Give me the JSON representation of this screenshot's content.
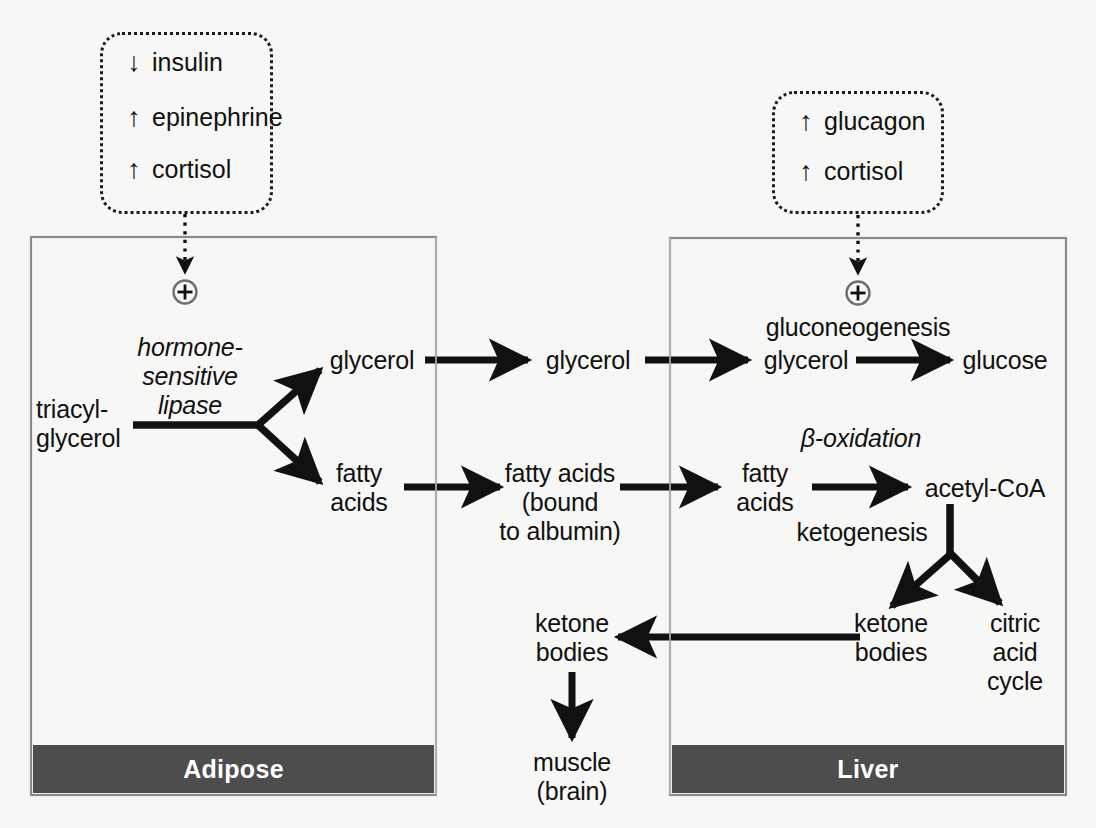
{
  "diagram": {
    "background_color": "#f7f7f5",
    "organ_bar_color": "#4d4d4d",
    "line_color": "#111111"
  },
  "hormone_boxes": [
    {
      "id": "adipose-hormones",
      "rows": [
        {
          "arrow": "↓",
          "direction": "down",
          "label": "insulin"
        },
        {
          "arrow": "↑",
          "direction": "up",
          "label": "epinephrine"
        },
        {
          "arrow": "↑",
          "direction": "up",
          "label": "cortisol"
        }
      ]
    },
    {
      "id": "liver-hormones",
      "rows": [
        {
          "arrow": "↑",
          "direction": "up",
          "label": "glucagon"
        },
        {
          "arrow": "↑",
          "direction": "up",
          "label": "cortisol"
        }
      ]
    }
  ],
  "compartments": [
    {
      "id": "adipose",
      "label": "Adipose"
    },
    {
      "id": "liver",
      "label": "Liver"
    }
  ],
  "plus_symbols": [
    {
      "id": "adipose-plus",
      "symbol": "⊕"
    },
    {
      "id": "liver-plus",
      "symbol": "⊕"
    }
  ],
  "metabolites": {
    "triacylglycerol": "triacyl-\nglycerol",
    "adipose_glycerol": "glycerol",
    "adipose_fatty_acids": "fatty\nacids",
    "blood_glycerol": "glycerol",
    "blood_fatty_acids": "fatty acids\n(bound\nto albumin)",
    "liver_glycerol": "glycerol",
    "glucose": "glucose",
    "liver_fatty_acids": "fatty\nacids",
    "acetyl_coa": "acetyl-CoA",
    "liver_ketone_bodies": "ketone\nbodies",
    "citric_acid_cycle": "citric\nacid\ncycle",
    "blood_ketone_bodies": "ketone\nbodies",
    "muscle_brain": "muscle\n(brain)"
  },
  "enzyme_labels": {
    "hormone_sensitive_lipase": "hormone-\nsensitive\nlipase",
    "gluconeogenesis": "gluconeogenesis",
    "beta_oxidation": "β-oxidation",
    "ketogenesis": "ketogenesis"
  }
}
